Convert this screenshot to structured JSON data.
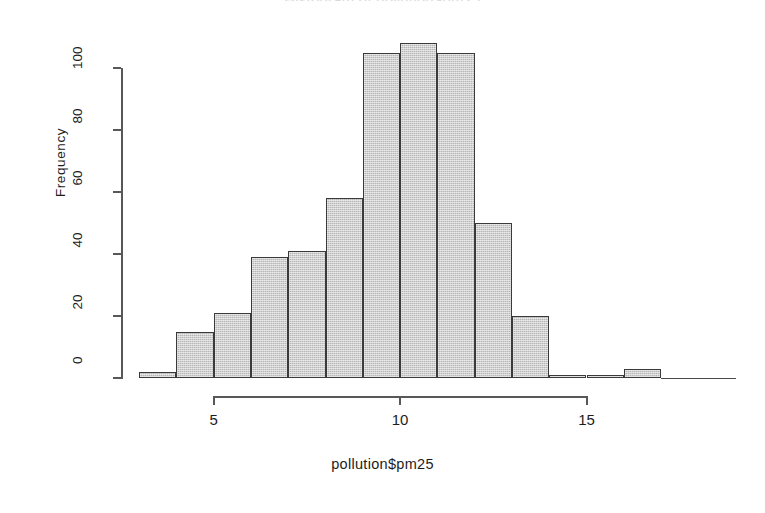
{
  "chart_data": {
    "type": "bar",
    "title": "Histogram of pollution$pm25",
    "xlabel": "pollution$pm25",
    "ylabel": "Frequency",
    "grid": false,
    "legend": null,
    "xlim": [
      3,
      19
    ],
    "ylim": [
      0,
      110
    ],
    "bin_width": 1,
    "bin_edges": [
      3,
      4,
      5,
      6,
      7,
      8,
      9,
      10,
      11,
      12,
      13,
      14,
      15,
      16,
      17,
      18,
      19
    ],
    "categories": [
      "3-4",
      "4-5",
      "5-6",
      "6-7",
      "7-8",
      "8-9",
      "9-10",
      "10-11",
      "11-12",
      "12-13",
      "13-14",
      "14-15",
      "15-16",
      "16-17",
      "17-18",
      "18-19"
    ],
    "values": [
      2,
      15,
      21,
      39,
      41,
      58,
      105,
      108,
      105,
      50,
      20,
      1,
      1,
      3,
      0,
      0
    ],
    "x_ticks": [
      5,
      10,
      15
    ],
    "x_tick_labels": [
      "5",
      "10",
      "15"
    ],
    "y_ticks": [
      0,
      20,
      40,
      60,
      80,
      100
    ],
    "y_tick_labels": [
      "0",
      "20",
      "40",
      "60",
      "80",
      "100"
    ],
    "bar_fill_color": "#b6b6b6",
    "bar_border_color": "#3a3a3a",
    "axis_color": "#585858",
    "background_color": "#ffffff"
  }
}
